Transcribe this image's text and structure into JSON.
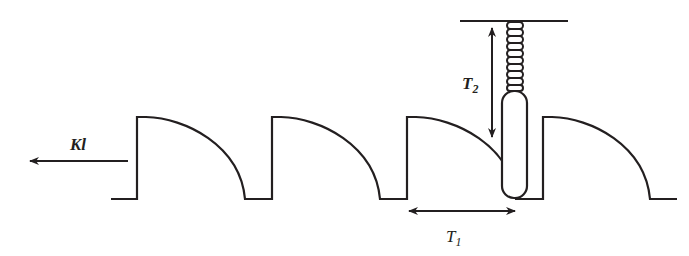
{
  "diagram": {
    "stroke_color": "#231f20",
    "background": "#ffffff",
    "labels": {
      "velocity": "Kl",
      "t1": "T",
      "t1_sub": "1",
      "t2": "T",
      "t2_sub": "2"
    },
    "components": {
      "pulses": 4,
      "motion_arrow": "leftward",
      "spring": "coil spring hanging from fixed top bar",
      "follower": "rounded capsule at end of spring",
      "t1_dimension": "horizontal double-headed arrow spanning one pulse width",
      "t2_dimension": "vertical double-headed arrow from top bar down to pulse level"
    }
  }
}
